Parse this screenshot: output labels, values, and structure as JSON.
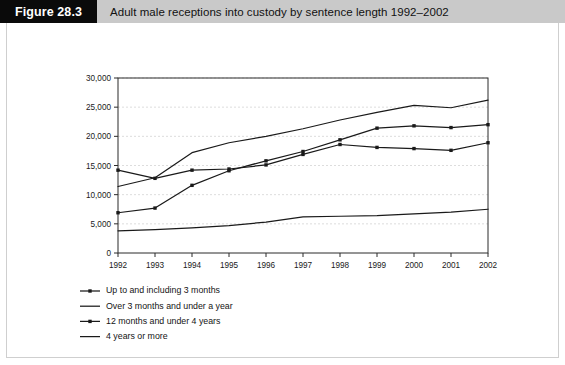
{
  "header": {
    "figure_tag": "Figure 28.3",
    "title": "Adult male receptions into custody by sentence length 1992–2002"
  },
  "chart_data": {
    "type": "line",
    "title": "Adult male receptions into custody by sentence length 1992–2002",
    "xlabel": "",
    "ylabel": "",
    "x": [
      1992,
      1993,
      1994,
      1995,
      1996,
      1997,
      1998,
      1999,
      2000,
      2001,
      2002
    ],
    "categories": [
      "1992",
      "1993",
      "1994",
      "1995",
      "1996",
      "1997",
      "1998",
      "1999",
      "2000",
      "2001",
      "2002"
    ],
    "xlim": [
      1992,
      2002
    ],
    "ylim": [
      0,
      30000
    ],
    "yticks": [
      0,
      5000,
      10000,
      15000,
      20000,
      25000,
      30000
    ],
    "ytick_labels": [
      "0",
      "5,000",
      "10,000",
      "15,000",
      "20,000",
      "25,000",
      "30,000"
    ],
    "grid": true,
    "grid_axis": "y",
    "legend_position": "below-left",
    "series": [
      {
        "name": "Up to and including 3 months",
        "marker": "square",
        "values": [
          14200,
          12800,
          14200,
          14400,
          15100,
          16900,
          18600,
          18100,
          17900,
          17600,
          18900
        ]
      },
      {
        "name": "Over 3 months and under a year",
        "marker": "none",
        "values": [
          11400,
          12900,
          17200,
          18900,
          20000,
          21300,
          22800,
          24100,
          25300,
          24900,
          26200
        ]
      },
      {
        "name": "12 months and under 4 years",
        "marker": "square",
        "values": [
          6900,
          7700,
          11600,
          14100,
          15800,
          17400,
          19400,
          21400,
          21800,
          21500,
          22000
        ]
      },
      {
        "name": "4 years or more",
        "marker": "none",
        "values": [
          3800,
          4000,
          4300,
          4700,
          5300,
          6200,
          6300,
          6400,
          6700,
          7000,
          7500
        ]
      }
    ]
  }
}
